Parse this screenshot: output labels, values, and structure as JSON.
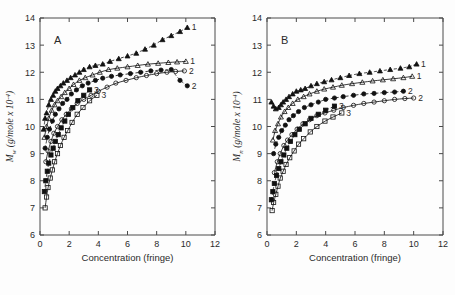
{
  "figure": {
    "panels": [
      {
        "id": "A",
        "panel_label": "A",
        "ylabel_main": "M",
        "ylabel_sub": "w",
        "ylabel_rest": " (g/mole x 10",
        "ylabel_exp": "-4",
        "ylabel_close": ")",
        "xlabel": "Concentration (fringe)"
      },
      {
        "id": "B",
        "panel_label": "B",
        "ylabel_main": "M",
        "ylabel_sub": "n",
        "ylabel_rest": " (g/mole x 10",
        "ylabel_exp": "-4",
        "ylabel_close": ")",
        "xlabel": "Concentration (fringe)"
      }
    ],
    "caption_clipped": "Figure  ...  (caption text clipped at image bottom)"
  },
  "chart_data": [
    {
      "type": "scatter",
      "panel": "A",
      "title": "A",
      "xlabel": "Concentration (fringe)",
      "ylabel": "Mw (g/mole x 10^-4)",
      "xlim": [
        0,
        12
      ],
      "ylim": [
        6,
        14
      ],
      "xticks": [
        0,
        2,
        4,
        6,
        8,
        10,
        12
      ],
      "yticks": [
        6,
        7,
        8,
        9,
        10,
        11,
        12,
        13,
        14
      ],
      "grid": false,
      "legend": "curve end labels",
      "series": [
        {
          "name": "filled-triangle",
          "marker": "filled-triangle",
          "curve": "dashed",
          "curve_label": "1",
          "x": [
            0.25,
            0.35,
            0.45,
            0.6,
            0.75,
            0.9,
            1.05,
            1.2,
            1.4,
            1.6,
            1.85,
            2.1,
            2.4,
            2.7,
            3.0,
            3.4,
            3.8,
            4.3,
            4.8,
            5.4,
            6.0,
            6.6,
            7.2,
            7.8,
            8.4,
            9.0,
            9.6,
            10.1
          ],
          "y": [
            9.9,
            10.3,
            10.5,
            10.8,
            11.0,
            11.15,
            11.3,
            11.4,
            11.5,
            11.6,
            11.7,
            11.8,
            11.9,
            12.0,
            12.1,
            12.2,
            12.25,
            12.3,
            12.4,
            12.5,
            12.6,
            12.7,
            12.85,
            13.0,
            13.2,
            13.35,
            13.5,
            13.65
          ]
        },
        {
          "name": "open-triangle",
          "marker": "open-triangle",
          "curve": "solid",
          "curve_label": "1",
          "x": [
            0.3,
            0.45,
            0.6,
            0.8,
            1.0,
            1.2,
            1.45,
            1.7,
            2.0,
            2.3,
            2.7,
            3.1,
            3.6,
            4.1,
            4.7,
            5.3,
            6.0,
            6.7,
            7.4,
            8.1,
            8.8,
            9.4,
            10.0
          ],
          "y": [
            9.6,
            10.0,
            10.3,
            10.6,
            10.8,
            10.95,
            11.1,
            11.25,
            11.4,
            11.55,
            11.7,
            11.8,
            11.9,
            12.0,
            12.1,
            12.15,
            12.2,
            12.25,
            12.3,
            12.33,
            12.36,
            12.38,
            12.4
          ]
        },
        {
          "name": "filled-circle",
          "marker": "filled-circle",
          "curve": "dashed",
          "curve_label": "2",
          "x": [
            0.35,
            0.5,
            0.65,
            0.85,
            1.05,
            1.3,
            1.55,
            1.85,
            2.15,
            2.5,
            2.9,
            3.3,
            3.8,
            4.3,
            4.9,
            5.5,
            6.2,
            6.9,
            7.6,
            8.3,
            9.0,
            9.6,
            10.1
          ],
          "y": [
            9.2,
            9.6,
            9.9,
            10.2,
            10.45,
            10.65,
            10.85,
            11.0,
            11.2,
            11.35,
            11.5,
            11.6,
            11.7,
            11.78,
            11.85,
            11.9,
            11.95,
            12.0,
            12.05,
            12.08,
            12.1,
            11.7,
            11.5
          ]
        },
        {
          "name": "open-circle",
          "marker": "open-circle",
          "curve": "solid",
          "curve_label": "2",
          "x": [
            0.4,
            0.55,
            0.75,
            0.95,
            1.2,
            1.5,
            1.8,
            2.15,
            2.55,
            3.0,
            3.5,
            4.0,
            4.6,
            5.2,
            5.9,
            6.6,
            7.3,
            8.0,
            8.7,
            9.3,
            9.9
          ],
          "y": [
            8.7,
            9.1,
            9.45,
            9.75,
            10.0,
            10.25,
            10.45,
            10.65,
            10.85,
            11.0,
            11.15,
            11.3,
            11.45,
            11.6,
            11.7,
            11.8,
            11.88,
            11.95,
            12.0,
            12.03,
            12.05
          ]
        },
        {
          "name": "filled-square",
          "marker": "filled-square",
          "curve": "dashed",
          "curve_label": "3",
          "x": [
            0.3,
            0.4,
            0.5,
            0.6,
            0.75,
            0.9,
            1.05,
            1.25,
            1.45,
            1.7,
            1.95,
            2.25,
            2.6,
            3.0,
            3.4
          ],
          "y": [
            7.6,
            8.0,
            8.35,
            8.65,
            8.95,
            9.2,
            9.45,
            9.7,
            9.95,
            10.2,
            10.45,
            10.7,
            10.95,
            11.15,
            11.35
          ]
        },
        {
          "name": "open-square",
          "marker": "open-square",
          "curve": "solid",
          "curve_label": "3",
          "x": [
            0.35,
            0.45,
            0.55,
            0.7,
            0.85,
            1.0,
            1.2,
            1.4,
            1.65,
            1.9,
            2.2,
            2.55,
            2.95,
            3.4,
            3.9
          ],
          "y": [
            7.0,
            7.4,
            7.75,
            8.1,
            8.4,
            8.7,
            9.0,
            9.3,
            9.6,
            9.85,
            10.15,
            10.45,
            10.7,
            10.95,
            11.15
          ]
        }
      ]
    },
    {
      "type": "scatter",
      "panel": "B",
      "title": "B",
      "xlabel": "Concentration (fringe)",
      "ylabel": "Mn (g/mole x 10^-4)",
      "xlim": [
        0,
        12
      ],
      "ylim": [
        6,
        14
      ],
      "xticks": [
        0,
        2,
        4,
        6,
        8,
        10,
        12
      ],
      "yticks": [
        6,
        7,
        8,
        9,
        10,
        11,
        12,
        13,
        14
      ],
      "grid": false,
      "legend": "curve end labels",
      "series": [
        {
          "name": "filled-triangle",
          "marker": "filled-triangle",
          "curve": "dashed",
          "curve_label": "1",
          "x": [
            0.3,
            0.45,
            0.6,
            0.8,
            0.95,
            1.1,
            1.3,
            1.5,
            1.75,
            2.0,
            2.3,
            2.6,
            3.0,
            3.4,
            3.9,
            4.4,
            5.0,
            5.6,
            6.3,
            7.0,
            7.7,
            8.4,
            9.1,
            9.7,
            10.2
          ],
          "y": [
            10.9,
            10.75,
            10.65,
            10.7,
            10.8,
            10.9,
            11.0,
            11.1,
            11.2,
            11.3,
            11.35,
            11.4,
            11.5,
            11.58,
            11.65,
            11.72,
            11.8,
            11.88,
            11.95,
            12.0,
            12.05,
            12.1,
            12.15,
            12.2,
            12.3
          ]
        },
        {
          "name": "open-triangle",
          "marker": "open-triangle",
          "curve": "solid",
          "curve_label": "1",
          "x": [
            0.4,
            0.55,
            0.75,
            0.95,
            1.2,
            1.45,
            1.75,
            2.1,
            2.5,
            2.9,
            3.4,
            3.9,
            4.5,
            5.1,
            5.8,
            6.5,
            7.2,
            7.9,
            8.6,
            9.3,
            9.9
          ],
          "y": [
            9.5,
            9.85,
            10.1,
            10.35,
            10.55,
            10.7,
            10.85,
            11.0,
            11.1,
            11.2,
            11.3,
            11.38,
            11.45,
            11.52,
            11.58,
            11.63,
            11.68,
            11.72,
            11.76,
            11.8,
            11.85
          ]
        },
        {
          "name": "filled-circle",
          "marker": "filled-circle",
          "curve": "dashed",
          "curve_label": "2",
          "x": [
            0.45,
            0.6,
            0.8,
            1.0,
            1.25,
            1.5,
            1.8,
            2.15,
            2.55,
            3.0,
            3.5,
            4.0,
            4.6,
            5.2,
            5.9,
            6.6,
            7.3,
            8.0,
            8.7,
            9.3
          ],
          "y": [
            9.0,
            9.35,
            9.6,
            9.85,
            10.05,
            10.25,
            10.4,
            10.55,
            10.7,
            10.8,
            10.9,
            11.0,
            11.05,
            11.1,
            11.15,
            11.2,
            11.22,
            11.25,
            11.27,
            11.3
          ]
        },
        {
          "name": "open-circle",
          "marker": "open-circle",
          "curve": "solid",
          "curve_label": "2",
          "x": [
            0.5,
            0.7,
            0.9,
            1.15,
            1.4,
            1.7,
            2.05,
            2.45,
            2.9,
            3.4,
            3.95,
            4.55,
            5.2,
            5.9,
            6.6,
            7.3,
            8.0,
            8.7,
            9.4,
            10.0
          ],
          "y": [
            8.3,
            8.7,
            9.0,
            9.3,
            9.5,
            9.7,
            9.9,
            10.1,
            10.25,
            10.4,
            10.5,
            10.6,
            10.7,
            10.78,
            10.85,
            10.9,
            10.95,
            11.0,
            11.03,
            11.05
          ]
        },
        {
          "name": "filled-square",
          "marker": "filled-square",
          "curve": "dashed",
          "curve_label": "3",
          "x": [
            0.3,
            0.4,
            0.5,
            0.65,
            0.8,
            0.95,
            1.15,
            1.35,
            1.6,
            1.9,
            2.2,
            2.6,
            3.0,
            3.5,
            4.0,
            4.6
          ],
          "y": [
            7.3,
            7.6,
            7.9,
            8.2,
            8.45,
            8.7,
            8.95,
            9.2,
            9.45,
            9.7,
            9.9,
            10.1,
            10.3,
            10.45,
            10.6,
            10.75
          ]
        },
        {
          "name": "open-square",
          "marker": "open-square",
          "curve": "solid",
          "curve_label": "3",
          "x": [
            0.35,
            0.45,
            0.6,
            0.75,
            0.9,
            1.1,
            1.3,
            1.55,
            1.85,
            2.15,
            2.5,
            2.95,
            3.4,
            3.95,
            4.5,
            5.1
          ],
          "y": [
            6.9,
            7.2,
            7.5,
            7.8,
            8.1,
            8.35,
            8.6,
            8.85,
            9.1,
            9.35,
            9.55,
            9.8,
            10.0,
            10.2,
            10.35,
            10.5
          ]
        }
      ]
    }
  ]
}
